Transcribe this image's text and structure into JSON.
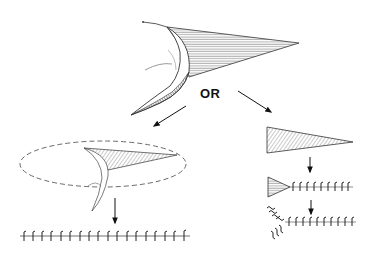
{
  "diagram": {
    "connector_label": "OR",
    "colors": {
      "background": "#ffffff",
      "stroke": "#222222",
      "hatch": "#555555",
      "dashed_outline": "#444444"
    },
    "panels": [
      {
        "id": "source",
        "description": "curved blade with hatched triangular sheet"
      },
      {
        "id": "path-left",
        "description": "sheet enclosed in dashed ellipse, then linear chain of units"
      },
      {
        "id": "path-right",
        "description": "hatched triangle, then triangle with chain, then branched chain"
      }
    ],
    "left_chain_units": 18,
    "right_chain_units_step1": 9,
    "right_chain_units_step2": 10
  }
}
